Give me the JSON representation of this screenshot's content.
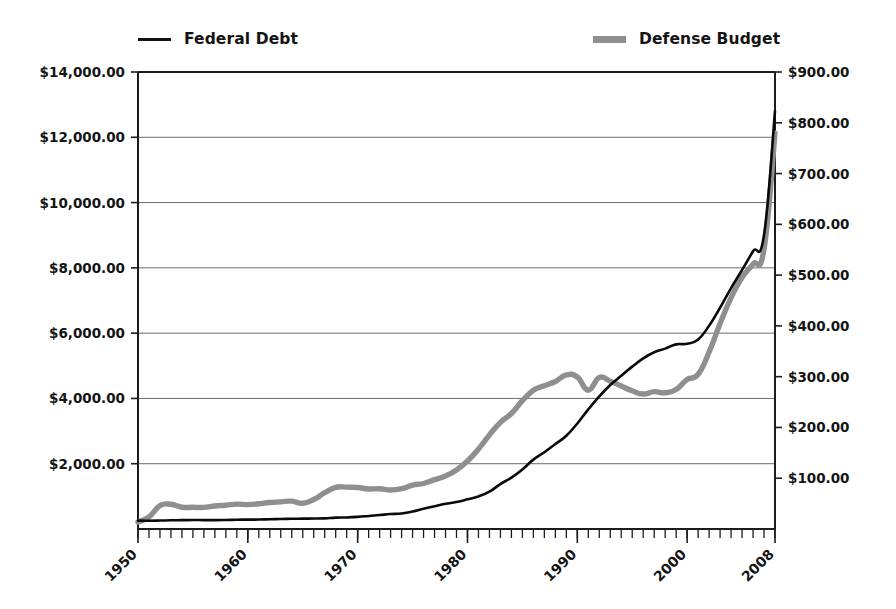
{
  "chart_data": {
    "type": "line",
    "title": "",
    "subtitle": "",
    "xlabel": "",
    "ylabel": "",
    "grid": true,
    "legend_position": "top",
    "x": [
      1950,
      1951,
      1952,
      1953,
      1954,
      1955,
      1956,
      1957,
      1958,
      1959,
      1960,
      1961,
      1962,
      1963,
      1964,
      1965,
      1966,
      1967,
      1968,
      1969,
      1970,
      1971,
      1972,
      1973,
      1974,
      1975,
      1976,
      1977,
      1978,
      1979,
      1980,
      1981,
      1982,
      1983,
      1984,
      1985,
      1986,
      1987,
      1988,
      1989,
      1990,
      1991,
      1992,
      1993,
      1994,
      1995,
      1996,
      1997,
      1998,
      1999,
      2000,
      2001,
      2002,
      2003,
      2004,
      2005,
      2006,
      2007,
      2008
    ],
    "x_tick_labels": [
      "1950",
      "1960",
      "1970",
      "1980",
      "1990",
      "2000",
      "2008"
    ],
    "x_tick_values": [
      1950,
      1960,
      1970,
      1980,
      1990,
      2000,
      2008
    ],
    "x_minor_tick_interval": 1,
    "xlim": [
      1950,
      2008
    ],
    "axes": [
      {
        "id": "left",
        "name": "Federal Debt axis",
        "series": "Federal Debt",
        "tick_labels": [
          "$14,000.00",
          "$12,000.00",
          "$10,000.00",
          "$8,000.00",
          "$6,000.00",
          "$4,000.00",
          "$2,000.00"
        ],
        "tick_values": [
          14000,
          12000,
          10000,
          8000,
          6000,
          4000,
          2000
        ],
        "ylim": [
          0,
          14000
        ],
        "units": "billions of dollars"
      },
      {
        "id": "right",
        "name": "Defense Budget axis",
        "series": "Defense Budget",
        "tick_labels": [
          "$900.00",
          "$800.00",
          "$700.00",
          "$600.00",
          "$500.00",
          "$400.00",
          "$300.00",
          "$200.00",
          "$100.00"
        ],
        "tick_values": [
          900,
          800,
          700,
          600,
          500,
          400,
          300,
          200,
          100
        ],
        "ylim": [
          0,
          900
        ],
        "units": "billions of dollars"
      }
    ],
    "series": [
      {
        "name": "Federal Debt",
        "axis": "left",
        "color": "#0a0a0a",
        "style": "thin-line",
        "values": [
          257,
          255,
          259,
          266,
          271,
          274,
          273,
          271,
          276,
          285,
          286,
          289,
          298,
          306,
          312,
          317,
          320,
          326,
          348,
          354,
          371,
          398,
          427,
          458,
          475,
          533,
          620,
          699,
          772,
          827,
          908,
          998,
          1142,
          1377,
          1572,
          1823,
          2125,
          2350,
          2602,
          2857,
          3233,
          3665,
          4064,
          4411,
          4693,
          4974,
          5225,
          5413,
          5526,
          5656,
          5674,
          5807,
          6228,
          6783,
          7379,
          7933,
          8507,
          9008,
          12800
        ]
      },
      {
        "name": "Defense Budget",
        "axis": "right",
        "color": "#8f8f8f",
        "style": "thick-line",
        "values": [
          13.7,
          23.6,
          46.1,
          48.7,
          42.8,
          42.7,
          42.5,
          45.4,
          46.8,
          49.0,
          48.1,
          49.6,
          52.3,
          53.4,
          54.8,
          50.6,
          58.1,
          71.4,
          81.9,
          82.5,
          81.7,
          78.9,
          79.2,
          76.7,
          79.3,
          86.5,
          89.6,
          97.2,
          104.5,
          116.3,
          134.0,
          157.5,
          185.3,
          209.9,
          227.4,
          252.7,
          273.4,
          282.0,
          290.4,
          303.6,
          299.3,
          273.3,
          298.4,
          291.1,
          281.6,
          272.1,
          265.8,
          270.5,
          268.2,
          274.8,
          294.4,
          304.7,
          348.5,
          404.7,
          455.8,
          495.3,
          521.8,
          551.2,
          780.0
        ]
      }
    ],
    "annotations": []
  },
  "legend": {
    "items": [
      {
        "label": "Federal Debt",
        "marker": "thin-black-line",
        "color": "#0a0a0a"
      },
      {
        "label": "Defense Budget",
        "marker": "thick-gray-line",
        "color": "#8f8f8f"
      }
    ]
  }
}
